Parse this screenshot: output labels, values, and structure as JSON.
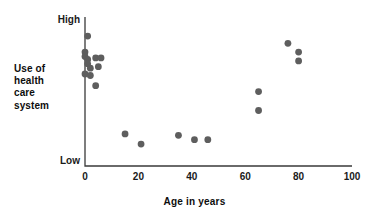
{
  "chart_data": {
    "type": "scatter",
    "title": "",
    "xlabel": "Age in years",
    "ylabel": "Use of health care system",
    "ylabel_lines": [
      "Use of",
      "health",
      "care",
      "system"
    ],
    "xlim": [
      0,
      100
    ],
    "ylim": [
      0,
      100
    ],
    "xticks": [
      0,
      20,
      40,
      60,
      80,
      100
    ],
    "xtick_labels": [
      "0",
      "20",
      "40",
      "60",
      "80",
      "100"
    ],
    "ytick_labels": [
      "High",
      "Low"
    ],
    "y_high_label": "High",
    "y_low_label": "Low",
    "grid": false,
    "legend": false,
    "marker_color": "#5e5e5e",
    "axis_color": "#3a3a3a",
    "points": [
      {
        "x": 1,
        "y": 89
      },
      {
        "x": 0,
        "y": 78
      },
      {
        "x": 0,
        "y": 75
      },
      {
        "x": 1,
        "y": 73
      },
      {
        "x": 1,
        "y": 70
      },
      {
        "x": 4,
        "y": 74
      },
      {
        "x": 6,
        "y": 74
      },
      {
        "x": 2,
        "y": 67
      },
      {
        "x": 5,
        "y": 68
      },
      {
        "x": 0,
        "y": 63
      },
      {
        "x": 2,
        "y": 62
      },
      {
        "x": 4,
        "y": 55
      },
      {
        "x": 15,
        "y": 22
      },
      {
        "x": 21,
        "y": 15
      },
      {
        "x": 35,
        "y": 21
      },
      {
        "x": 41,
        "y": 18
      },
      {
        "x": 46,
        "y": 18
      },
      {
        "x": 65,
        "y": 51
      },
      {
        "x": 65,
        "y": 38
      },
      {
        "x": 76,
        "y": 84
      },
      {
        "x": 80,
        "y": 78
      },
      {
        "x": 80,
        "y": 72
      }
    ]
  }
}
